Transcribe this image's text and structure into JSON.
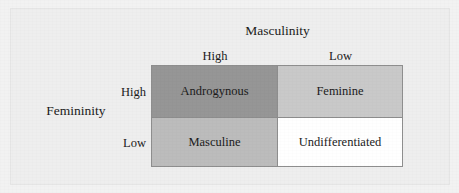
{
  "figure": {
    "type": "2x2-matrix"
  },
  "column_axis": {
    "title": "Masculinity",
    "levels": [
      "High",
      "Low"
    ]
  },
  "row_axis": {
    "title": "Femininity",
    "levels": [
      "High",
      "Low"
    ]
  },
  "cells": [
    {
      "label": "Androgynous",
      "row": "High",
      "column": "High",
      "fill": "#969696"
    },
    {
      "label": "Feminine",
      "row": "High",
      "column": "Low",
      "fill": "#c9c9c9"
    },
    {
      "label": "Masculine",
      "row": "Low",
      "column": "High",
      "fill": "#bcbcbc"
    },
    {
      "label": "Undifferentiated",
      "row": "Low",
      "column": "Low",
      "fill": "#ffffff"
    }
  ],
  "colors": {
    "page_background": "#f2f2f2",
    "card_background": "#eeeeee",
    "cell_border": "#8e8e8e",
    "text": "#1b1b1b"
  }
}
